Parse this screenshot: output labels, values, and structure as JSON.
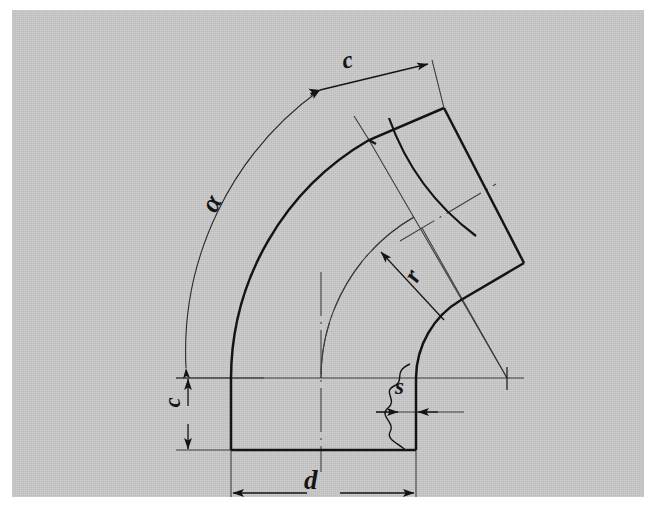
{
  "drawing": {
    "title": "Pipe elbow (bend) dimensioned technical drawing",
    "type": "engineering-line-drawing",
    "page_background_color": "#c9c9c9",
    "line_color": "#141414",
    "thin_line_color": "#3a3a3a",
    "sheet_margin_color": "#ffffff"
  },
  "labels": {
    "angle": "α",
    "end_length_top": "c",
    "end_length_left": "c",
    "bend_radius": "r",
    "diameter": "d",
    "wall_thickness": "s"
  },
  "label_meanings": {
    "angle": "bend angle alpha",
    "end_length_top": "tangent end length c at angled outlet",
    "end_length_left": "tangent end length c at straight inlet",
    "bend_radius": "bend radius r measured from centre point",
    "diameter": "nominal outside diameter d",
    "wall_thickness": "wall thickness s"
  },
  "geometry": {
    "bend_centre": [
      483,
      358
    ],
    "horizontal_centreline_y": 358,
    "pipe_left_wall_x": 207,
    "pipe_axis_x": 297,
    "pipe_right_wall_x": 392,
    "pipe_bottom_edge_y": 430,
    "bend_angle_degrees": 60,
    "outer_radius": 276,
    "inner_radius": 91,
    "axis_radius": 186,
    "alpha_arc_radius": 322
  },
  "elements": {
    "break_line": "wavy-break-line",
    "centre_mark": "centre-cross-mark",
    "dimension_arrows": "filled-triangular-arrowheads"
  }
}
